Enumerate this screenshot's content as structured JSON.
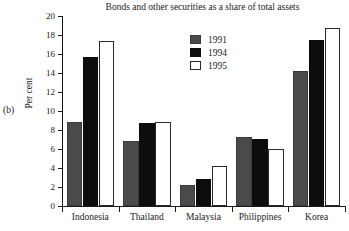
{
  "panel_label": "(b)",
  "chart_data": {
    "type": "bar",
    "title": "Bonds and other securities as a share of total assets",
    "xlabel": "",
    "ylabel": "Per cent",
    "ylim": [
      0,
      20
    ],
    "ytick_step": 2,
    "yticks": [
      "20",
      "18",
      "16",
      "14",
      "12",
      "10",
      "8",
      "6",
      "4",
      "2",
      "0"
    ],
    "grid": false,
    "legend_position": "upper-center",
    "categories": [
      "Indonesia",
      "Thailand",
      "Malaysia",
      "Philippines",
      "Korea"
    ],
    "series": [
      {
        "name": "1991",
        "color": "#4a4a4a",
        "values": [
          8.8,
          6.8,
          2.2,
          7.3,
          14.2
        ]
      },
      {
        "name": "1994",
        "color": "#0d0d0d",
        "values": [
          15.7,
          8.7,
          2.8,
          7.1,
          17.5
        ]
      },
      {
        "name": "1995",
        "color": "#ffffff",
        "values": [
          17.4,
          8.8,
          4.2,
          6.0,
          18.7
        ]
      }
    ]
  }
}
